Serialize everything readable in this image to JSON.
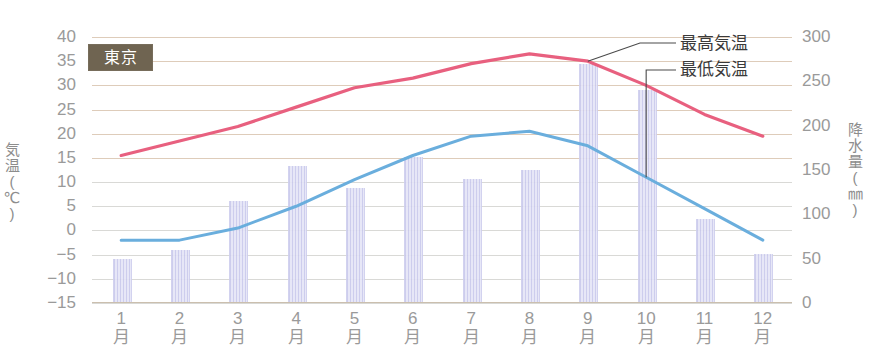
{
  "chart_data": {
    "type": "bar",
    "title": "東京",
    "categories": [
      "1月",
      "2月",
      "3月",
      "4月",
      "5月",
      "6月",
      "7月",
      "8月",
      "9月",
      "10月",
      "11月",
      "12月"
    ],
    "xlabel": "",
    "grid": true,
    "legend_position": "inline-annotation",
    "axes": {
      "left": {
        "label": "気温(℃)",
        "label_chars": [
          "気",
          "温",
          "(",
          "℃",
          ")"
        ],
        "unit": "℃",
        "min": -15,
        "max": 40,
        "step": 5,
        "ticks": [
          "40",
          "35",
          "30",
          "25",
          "20",
          "15",
          "10",
          "5",
          "0",
          "−5",
          "−10",
          "−15"
        ],
        "tick_values": [
          40,
          35,
          30,
          25,
          20,
          15,
          10,
          5,
          0,
          -5,
          -10,
          -15
        ]
      },
      "right": {
        "label": "降水量(㎜)",
        "label_chars": [
          "降",
          "水",
          "量",
          "(",
          "㎜",
          ")"
        ],
        "unit": "㎜",
        "min": 0,
        "max": 300,
        "step": 50,
        "ticks": [
          "300",
          "250",
          "200",
          "150",
          "100",
          "50",
          "0"
        ],
        "tick_values": [
          300,
          250,
          200,
          150,
          100,
          50,
          0
        ]
      }
    },
    "series": [
      {
        "name": "降水量",
        "type": "bar",
        "axis": "right",
        "unit": "㎜",
        "color": "#c9c9ec",
        "values": [
          50,
          60,
          115,
          155,
          130,
          165,
          140,
          150,
          270,
          240,
          95,
          55
        ]
      },
      {
        "name": "最高気温",
        "type": "line",
        "axis": "left",
        "unit": "℃",
        "color": "#e8607f",
        "values": [
          15.5,
          18.5,
          21.5,
          25.5,
          29.5,
          31.5,
          34.5,
          36.5,
          35.0,
          30.0,
          24.0,
          19.5
        ]
      },
      {
        "name": "最低気温",
        "type": "line",
        "axis": "left",
        "unit": "℃",
        "color": "#6aaedd",
        "values": [
          -2.0,
          -2.0,
          0.5,
          5.0,
          10.5,
          15.5,
          19.5,
          20.5,
          17.5,
          11.0,
          4.5,
          -2.0
        ]
      }
    ],
    "annotations": [
      {
        "name": "最高気温",
        "target_series": "最高気温",
        "target_month_index": 8
      },
      {
        "name": "最低気温",
        "target_series": "最低気温",
        "target_month_index": 9
      }
    ]
  }
}
